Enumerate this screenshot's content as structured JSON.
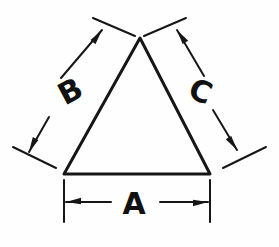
{
  "figure": {
    "background_color": "#fefefe",
    "ink_color": "#161616",
    "shape": {
      "name": "triangle",
      "type": "equilateral",
      "apex": {
        "x": 140,
        "y": 38
      },
      "bottom_left": {
        "x": 64,
        "y": 174
      },
      "bottom_right": {
        "x": 210,
        "y": 174
      }
    },
    "dimensions": [
      {
        "id": "A",
        "label": "A",
        "side": "base",
        "orientation": "horizontal",
        "label_x": 134,
        "label_y": 205,
        "label_rotation": 0,
        "font_size": 30,
        "extension_line_1": {
          "x1": 64,
          "y1": 180,
          "x2": 64,
          "y2": 222
        },
        "extension_line_2": {
          "x1": 210,
          "y1": 180,
          "x2": 210,
          "y2": 222
        },
        "dimension_line_1": {
          "x1": 111,
          "y1": 202,
          "x2": 66,
          "y2": 202
        },
        "dimension_line_2": {
          "x1": 160,
          "y1": 202,
          "x2": 208,
          "y2": 202
        },
        "arrow_1_tip": {
          "x": 66,
          "y": 202
        },
        "arrow_2_tip": {
          "x": 208,
          "y": 202
        }
      },
      {
        "id": "B",
        "label": "B",
        "side": "left",
        "orientation": "diagonal-up-right",
        "label_x": 71,
        "label_y": 93,
        "label_rotation": -28,
        "font_size": 30,
        "extension_line_1": {
          "x1": 93,
          "y1": 18,
          "x2": 135,
          "y2": 36
        },
        "extension_line_2": {
          "x1": 13,
          "y1": 147,
          "x2": 56,
          "y2": 168
        },
        "dimension_line_1": {
          "x1": 61,
          "y1": 78,
          "x2": 102,
          "y2": 30
        },
        "dimension_line_2": {
          "x1": 49,
          "y1": 117,
          "x2": 29,
          "y2": 152
        },
        "arrow_1_tip": {
          "x": 102,
          "y": 30
        },
        "arrow_2_tip": {
          "x": 29,
          "y": 152
        }
      },
      {
        "id": "C",
        "label": "C",
        "side": "right",
        "orientation": "diagonal-down-right",
        "label_x": 200,
        "label_y": 93,
        "label_rotation": 22,
        "font_size": 30,
        "extension_line_1": {
          "x1": 186,
          "y1": 18,
          "x2": 144,
          "y2": 36
        },
        "extension_line_2": {
          "x1": 266,
          "y1": 147,
          "x2": 223,
          "y2": 168
        },
        "dimension_line_1": {
          "x1": 204,
          "y1": 76,
          "x2": 177,
          "y2": 30
        },
        "dimension_line_2": {
          "x1": 213,
          "y1": 110,
          "x2": 237,
          "y2": 150
        },
        "arrow_1_tip": {
          "x": 177,
          "y": 30
        },
        "arrow_2_tip": {
          "x": 237,
          "y": 150
        }
      }
    ],
    "stroke_widths": {
      "shape": 3,
      "dimension_line": 2,
      "extension_line": 2
    }
  }
}
